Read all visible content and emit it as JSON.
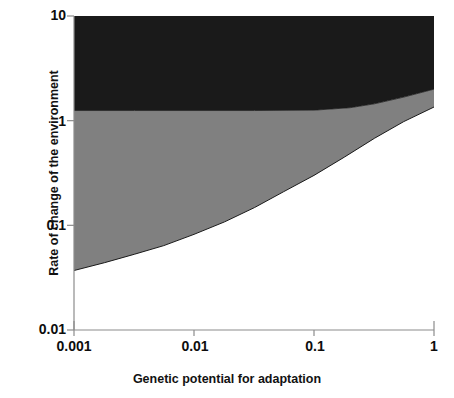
{
  "chart_data": {
    "type": "area",
    "title": "",
    "xlabel": "Genetic potential for adaptation",
    "ylabel": "Rate of change of the environment",
    "xscale": "log",
    "yscale": "log",
    "xlim": [
      0.001,
      1
    ],
    "ylim": [
      0.01,
      10
    ],
    "xticks": [
      "0.001",
      "0.01",
      "0.1",
      "1"
    ],
    "xtick_values": [
      0.001,
      0.01,
      0.1,
      1
    ],
    "yticks": [
      "10",
      "1",
      "0.1",
      "0.01"
    ],
    "ytick_values": [
      10,
      1,
      0.1,
      0.01
    ],
    "grid": false,
    "legend": "none",
    "series": [
      {
        "name": "extinction-region",
        "role": "upper band (black fill)",
        "color": "#1a1a1a",
        "description": "Region above the upper boundary curve, filled solid black up to the top of the axis (10).",
        "boundary_name": "upper-boundary",
        "x": [
          0.001,
          0.0032,
          0.01,
          0.032,
          0.1,
          0.2,
          0.32,
          0.56,
          1.0
        ],
        "y": [
          1.25,
          1.25,
          1.25,
          1.25,
          1.26,
          1.33,
          1.45,
          1.68,
          2.0
        ]
      },
      {
        "name": "persistence-region",
        "role": "middle band (gray fill)",
        "color": "#808080",
        "description": "Region between the lower boundary curve and the upper boundary curve, filled medium gray.",
        "boundary_name": "lower-boundary",
        "x": [
          0.001,
          0.0018,
          0.0032,
          0.0056,
          0.01,
          0.018,
          0.032,
          0.056,
          0.1,
          0.18,
          0.32,
          0.56,
          1.0
        ],
        "y": [
          0.037,
          0.044,
          0.053,
          0.064,
          0.082,
          0.108,
          0.148,
          0.21,
          0.3,
          0.45,
          0.68,
          0.98,
          1.35
        ]
      },
      {
        "name": "safe-region",
        "role": "lower band (white / unfilled)",
        "color": "#ffffff",
        "description": "Region below the lower boundary curve, left unfilled (white).",
        "x": [
          0.001,
          1.0
        ],
        "y": [
          0.01,
          0.01
        ]
      }
    ],
    "colors": {
      "black_band": "#1a1a1a",
      "gray_band": "#808080",
      "white_band": "#ffffff",
      "axis": "#808080",
      "text": "#0d0d0d"
    }
  },
  "axis": {
    "y_title": "Rate of change of the environment",
    "x_title": "Genetic potential for adaptation",
    "y_labels": [
      "10",
      "1",
      "0.1",
      "0.01"
    ],
    "x_labels": [
      "0.001",
      "0.01",
      "0.1",
      "1"
    ]
  }
}
